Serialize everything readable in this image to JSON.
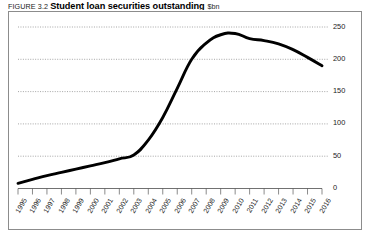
{
  "caption": {
    "figure_number": "FIGURE 3.2",
    "title": "Student loan securities outstanding",
    "units": "$bn"
  },
  "chart_data": {
    "type": "line",
    "title": "Student loan securities outstanding",
    "xlabel": "",
    "ylabel": "$bn",
    "ylim": [
      0,
      250
    ],
    "xlim": [
      1995,
      2016
    ],
    "grid": true,
    "y_axis_position": "right",
    "legend": "none",
    "yticks": [
      0,
      50,
      100,
      150,
      200,
      250
    ],
    "ytick_labels": [
      "0",
      "50",
      "100",
      "150",
      "200",
      "250"
    ],
    "categories": [
      "1995",
      "1996",
      "1997",
      "1998",
      "1999",
      "2000",
      "2001",
      "2002",
      "2003",
      "2004",
      "2005",
      "2006",
      "2007",
      "2008",
      "2009",
      "2010",
      "2011",
      "2012",
      "2013",
      "2014",
      "2015",
      "2016"
    ],
    "series": [
      {
        "name": "Student loan securities outstanding",
        "values": [
          8,
          14,
          20,
          25,
          30,
          35,
          40,
          46,
          52,
          75,
          110,
          155,
          200,
          225,
          238,
          240,
          232,
          229,
          224,
          215,
          203,
          190
        ]
      }
    ]
  }
}
